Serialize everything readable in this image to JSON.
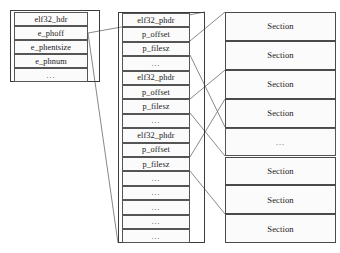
{
  "diagram": {
    "colors": {
      "background": "#ffffff",
      "row_fill": "#fbfbfb",
      "row_border": "#555555",
      "frame_border": "#3c3c3c",
      "connector": "#6b6b6b",
      "text": "#1a1a1a"
    },
    "ellipsis": "...",
    "elf_header_box": {
      "name": "elf32-header-box",
      "rows": [
        {
          "label": "elf32_hdr",
          "kind": "title"
        },
        {
          "label": "e_phoff",
          "kind": "field"
        },
        {
          "label": "e_phentsize",
          "kind": "field"
        },
        {
          "label": "e_phnum",
          "kind": "field"
        },
        {
          "label": "...",
          "kind": "ellipsis"
        }
      ]
    },
    "program_header_column": {
      "name": "program-header-table",
      "rows": [
        {
          "label": "elf32_phdr",
          "kind": "title"
        },
        {
          "label": "p_offset",
          "kind": "field"
        },
        {
          "label": "p_filesz",
          "kind": "field"
        },
        {
          "label": "...",
          "kind": "ellipsis"
        },
        {
          "label": "elf32_phdr",
          "kind": "title"
        },
        {
          "label": "p_offset",
          "kind": "field"
        },
        {
          "label": "p_filesz",
          "kind": "field"
        },
        {
          "label": "...",
          "kind": "ellipsis"
        },
        {
          "label": "elf32_phdr",
          "kind": "title"
        },
        {
          "label": "p_offset",
          "kind": "field"
        },
        {
          "label": "p_filesz",
          "kind": "field"
        },
        {
          "label": "...",
          "kind": "ellipsis"
        },
        {
          "label": "...",
          "kind": "ellipsis"
        },
        {
          "label": "...",
          "kind": "ellipsis"
        },
        {
          "label": "...",
          "kind": "ellipsis"
        },
        {
          "label": "...",
          "kind": "ellipsis"
        }
      ]
    },
    "sections_column": {
      "name": "sections-table",
      "rows": [
        {
          "label": "Section",
          "kind": "section"
        },
        {
          "label": "Section",
          "kind": "section"
        },
        {
          "label": "Section",
          "kind": "section"
        },
        {
          "label": "Section",
          "kind": "section"
        },
        {
          "label": "...",
          "kind": "ellipsis"
        },
        {
          "label": "Section",
          "kind": "section"
        },
        {
          "label": "Section",
          "kind": "section"
        },
        {
          "label": "Section",
          "kind": "section"
        }
      ]
    },
    "connectors": [
      {
        "from": "e_phoff",
        "to": "program-header-table-top"
      },
      {
        "from": "e_phoff",
        "to": "program-header-table-bottom"
      },
      {
        "from": "p_offset-1",
        "to": "section-row-1"
      },
      {
        "from": "p_filesz-1",
        "to": "section-row-5"
      },
      {
        "from": "p_offset-2",
        "to": "section-row-3"
      },
      {
        "from": "p_filesz-2",
        "to": "section-row-6"
      },
      {
        "from": "p_offset-3",
        "to": "section-row-4"
      },
      {
        "from": "p_filesz-3",
        "to": "section-row-8"
      }
    ]
  }
}
